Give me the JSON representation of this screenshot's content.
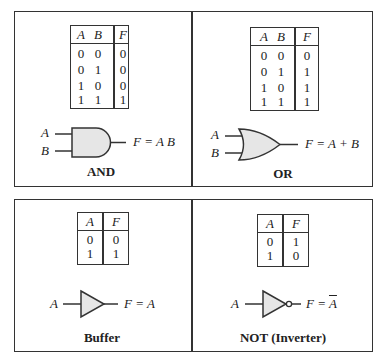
{
  "panels": [
    {
      "name": "AND",
      "inputs": [
        "A",
        "B"
      ],
      "output_expression": "F = A B",
      "truth_table": {
        "headers": [
          "A",
          "B",
          "F"
        ],
        "rows": [
          [
            "0",
            "0",
            "0"
          ],
          [
            "0",
            "1",
            "0"
          ],
          [
            "1",
            "0",
            "0"
          ],
          [
            "1",
            "1",
            "1"
          ]
        ]
      }
    },
    {
      "name": "OR",
      "inputs": [
        "A",
        "B"
      ],
      "output_expression": "F = A + B",
      "truth_table": {
        "headers": [
          "A",
          "B",
          "F"
        ],
        "rows": [
          [
            "0",
            "0",
            "0"
          ],
          [
            "0",
            "1",
            "1"
          ],
          [
            "1",
            "0",
            "1"
          ],
          [
            "1",
            "1",
            "1"
          ]
        ]
      }
    },
    {
      "name": "Buffer",
      "inputs": [
        "A"
      ],
      "output_expression": "F = A",
      "truth_table": {
        "headers": [
          "A",
          "F"
        ],
        "rows": [
          [
            "0",
            "0"
          ],
          [
            "1",
            "1"
          ]
        ]
      }
    },
    {
      "name": "NOT (Inverter)",
      "inputs": [
        "A"
      ],
      "output_expression_prefix": "F = ",
      "output_expression_overbar": "A",
      "truth_table": {
        "headers": [
          "A",
          "F"
        ],
        "rows": [
          [
            "0",
            "1"
          ],
          [
            "1",
            "0"
          ]
        ]
      }
    }
  ],
  "colors": {
    "gate_fill": "#e6e6e6",
    "line": "#333333"
  }
}
